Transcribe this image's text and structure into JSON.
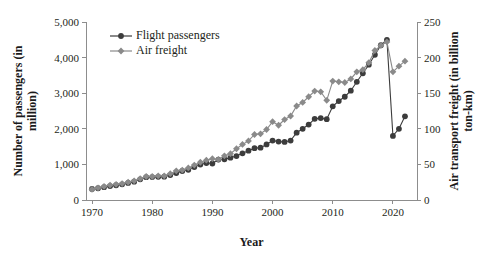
{
  "chart_data": {
    "type": "line",
    "title": "",
    "xlabel": "Year",
    "ylabel": "Number of passengers (in million)",
    "y2label": "Air transport freight (in billion ton-km)",
    "grid": false,
    "legend_position": "top-left-inside",
    "xlim": [
      1969,
      2024
    ],
    "ylim": [
      0,
      5000
    ],
    "y2lim": [
      0,
      250
    ],
    "xticks": [
      1970,
      1980,
      1990,
      2000,
      2010,
      2020
    ],
    "xticklabels": [
      "1970",
      "1980",
      "1990",
      "2000",
      "2010",
      "2020"
    ],
    "yticks": [
      0,
      1000,
      2000,
      3000,
      4000,
      5000
    ],
    "yticklabels": [
      "0",
      "1,000",
      "2,000",
      "3,000",
      "4,000",
      "5,000"
    ],
    "y2ticks": [
      0,
      50,
      100,
      150,
      200,
      250
    ],
    "y2ticklabels": [
      "0",
      "50",
      "100",
      "150",
      "200",
      "250"
    ],
    "x": [
      1970,
      1971,
      1972,
      1973,
      1974,
      1975,
      1976,
      1977,
      1978,
      1979,
      1980,
      1981,
      1982,
      1983,
      1984,
      1985,
      1986,
      1987,
      1988,
      1989,
      1990,
      1991,
      1992,
      1993,
      1994,
      1995,
      1996,
      1997,
      1998,
      1999,
      2000,
      2001,
      2002,
      2003,
      2004,
      2005,
      2006,
      2007,
      2008,
      2009,
      2010,
      2011,
      2012,
      2013,
      2014,
      2015,
      2016,
      2017,
      2018,
      2019,
      2020,
      2021,
      2022
    ],
    "series": [
      {
        "name": "Flight passengers",
        "axis": "left",
        "color": "#3c3c3c",
        "marker": "circle",
        "units": "million passengers",
        "values": [
          310,
          330,
          360,
          390,
          415,
          440,
          480,
          515,
          580,
          640,
          645,
          650,
          655,
          700,
          755,
          815,
          850,
          925,
          995,
          1040,
          1025,
          1135,
          1145,
          1190,
          1235,
          1310,
          1385,
          1455,
          1470,
          1560,
          1670,
          1640,
          1630,
          1670,
          1890,
          2000,
          2120,
          2280,
          2300,
          2270,
          2630,
          2780,
          2900,
          3070,
          3320,
          3560,
          3800,
          4080,
          4350,
          4500,
          1800,
          2000,
          2350
        ]
      },
      {
        "name": "Air freight",
        "axis": "right",
        "color": "#8a8a8a",
        "marker": "diamond",
        "units": "billion ton-km",
        "values": [
          15,
          17,
          19,
          21,
          22,
          23,
          25,
          27,
          30,
          33,
          33,
          34,
          34,
          37,
          41,
          42,
          45,
          49,
          53,
          56,
          58,
          57,
          62,
          65,
          72,
          78,
          83,
          92,
          93,
          99,
          110,
          105,
          113,
          118,
          132,
          137,
          145,
          153,
          152,
          140,
          167,
          166,
          165,
          170,
          180,
          183,
          193,
          210,
          217,
          222,
          180,
          188,
          195
        ]
      }
    ],
    "annotations": []
  },
  "legend": {
    "entries": [
      {
        "label": "Flight passengers",
        "marker": "circle",
        "color": "#3c3c3c"
      },
      {
        "label": "Air freight",
        "marker": "diamond",
        "color": "#8a8a8a"
      }
    ]
  }
}
